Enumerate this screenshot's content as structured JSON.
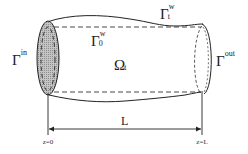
{
  "diagram": {
    "type": "tube-domain-schematic",
    "labels": {
      "inlet": {
        "symbol": "Γ",
        "superscript": "in"
      },
      "outlet": {
        "symbol": "Γ",
        "superscript": "out"
      },
      "wall_reference": {
        "symbol": "Γ",
        "superscript": "w",
        "subscript": "0"
      },
      "wall_current": {
        "symbol": "Γ",
        "superscript": "w",
        "subscript": "t"
      },
      "domain": {
        "symbol": "Ω",
        "subscript": "t"
      },
      "length": "L",
      "z_start": "z=0",
      "z_end": "z=L"
    },
    "colors": {
      "stroke": "#222222",
      "inlet_fill": "#b8b8b8",
      "background": "#ffffff"
    }
  }
}
